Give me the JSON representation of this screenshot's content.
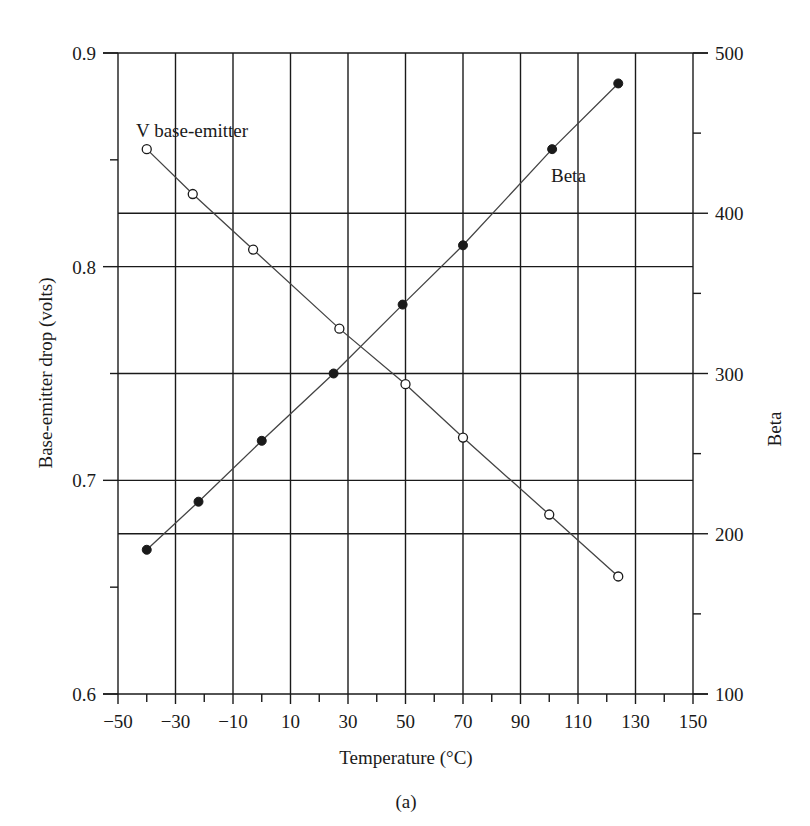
{
  "chart_data": {
    "type": "line",
    "title": "",
    "caption": "(a)",
    "xlabel": "Temperature (°C)",
    "ylabel": "Base-emitter drop (volts)",
    "y2label": "Beta",
    "xlim": [
      -50,
      150
    ],
    "ylim": [
      0.6,
      0.9
    ],
    "y2lim": [
      100,
      500
    ],
    "grid": true,
    "x_ticks": [
      -50,
      -30,
      -10,
      10,
      30,
      50,
      70,
      90,
      110,
      130,
      150
    ],
    "x_tick_labels": [
      "−50",
      "−30",
      "−10",
      "10",
      "30",
      "50",
      "70",
      "90",
      "110",
      "130",
      "150"
    ],
    "x_minor_ticks": [
      -40,
      -20,
      0,
      20,
      40,
      60,
      80,
      100,
      120,
      140
    ],
    "y_ticks": [
      0.6,
      0.7,
      0.8,
      0.9
    ],
    "y_tick_labels": [
      "0.6",
      "0.7",
      "0.8",
      "0.9"
    ],
    "y_minor_ticks": [
      0.65,
      0.75,
      0.85
    ],
    "y_gridlines": [
      0.7,
      0.75,
      0.8
    ],
    "y2_ticks": [
      100,
      200,
      300,
      400,
      500
    ],
    "y2_tick_labels": [
      "100",
      "200",
      "300",
      "400",
      "500"
    ],
    "y2_minor_ticks": [
      150,
      250,
      350,
      450
    ],
    "y2_gridlines": [
      200,
      400
    ],
    "series": [
      {
        "name": "V base-emitter",
        "axis": "left",
        "marker": "open-circle",
        "x": [
          -40,
          -24,
          -3,
          27,
          50,
          70,
          100,
          124
        ],
        "values": [
          0.855,
          0.834,
          0.808,
          0.771,
          0.745,
          0.72,
          0.684,
          0.655
        ]
      },
      {
        "name": "Beta",
        "axis": "right",
        "marker": "filled-circle",
        "x": [
          -40,
          -22,
          0,
          25,
          49,
          70,
          101,
          124
        ],
        "values": [
          190,
          220,
          258,
          300,
          343,
          380,
          440,
          481
        ]
      }
    ],
    "annotations": [
      {
        "text": "V base-emitter",
        "near_series": "V base-emitter"
      },
      {
        "text": "Beta",
        "near_series": "Beta"
      }
    ]
  },
  "labels": {
    "xlabel": "Temperature (°C)",
    "ylabel": "Base-emitter drop (volts)",
    "y2label": "Beta",
    "caption": "(a)",
    "annot_vbe": "V base-emitter",
    "annot_beta": "Beta"
  },
  "colors": {
    "ink": "#1a1a1a",
    "line": "#444444",
    "background": "#ffffff"
  }
}
